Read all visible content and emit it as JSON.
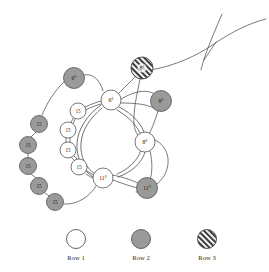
{
  "diagram": {
    "title": "",
    "background_color": "#ffffff",
    "stroke_color": "#4d4d4d",
    "node_stroke_color": "#555555",
    "fill_row1": "#ffffff",
    "fill_row2": "#9a9a9a",
    "fill_row3_base": "#ffffff",
    "fill_row3_hatch": "#3a3a3a",
    "label_color": "#1a1a1a",
    "nodes": [
      {
        "id": "n-gray-6",
        "label": "6°",
        "row": 2,
        "cx": 74,
        "cy": 78,
        "r": 10.5
      },
      {
        "id": "n-hatch-8",
        "label": "8°",
        "row": 3,
        "cx": 142,
        "cy": 68,
        "r": 11.0
      },
      {
        "id": "n-white-6",
        "label": "6°",
        "row": 1,
        "cx": 111,
        "cy": 100,
        "r": 10.0
      },
      {
        "id": "n-gray-8",
        "label": "8°",
        "row": 2,
        "cx": 161,
        "cy": 101,
        "r": 10.5
      },
      {
        "id": "n-white-8",
        "label": "8°",
        "row": 1,
        "cx": 145,
        "cy": 142,
        "r": 10.0
      },
      {
        "id": "n-white-11",
        "label": "11°",
        "row": 1,
        "cx": 103,
        "cy": 178,
        "r": 10.0
      },
      {
        "id": "n-gray-11",
        "label": "11°",
        "row": 2,
        "cx": 147,
        "cy": 188,
        "r": 10.5
      },
      {
        "id": "n-white-15-a",
        "label": "15",
        "row": 1,
        "cx": 78,
        "cy": 111,
        "r": 8.0
      },
      {
        "id": "n-white-15-b",
        "label": "15",
        "row": 1,
        "cx": 68,
        "cy": 130,
        "r": 8.0
      },
      {
        "id": "n-white-15-c",
        "label": "15",
        "row": 1,
        "cx": 68,
        "cy": 150,
        "r": 8.0
      },
      {
        "id": "n-white-15-d",
        "label": "15",
        "row": 1,
        "cx": 79,
        "cy": 167,
        "r": 8.0
      },
      {
        "id": "n-gray-15-a",
        "label": "15",
        "row": 2,
        "cx": 39,
        "cy": 124,
        "r": 8.5
      },
      {
        "id": "n-gray-15-b",
        "label": "15",
        "row": 2,
        "cx": 28,
        "cy": 145,
        "r": 8.5
      },
      {
        "id": "n-gray-15-c",
        "label": "15",
        "row": 2,
        "cx": 28,
        "cy": 166,
        "r": 8.5
      },
      {
        "id": "n-gray-15-d",
        "label": "15",
        "row": 2,
        "cx": 39,
        "cy": 186,
        "r": 8.5
      },
      {
        "id": "n-gray-15-e",
        "label": "15",
        "row": 2,
        "cx": 55,
        "cy": 202,
        "r": 8.5
      }
    ],
    "node_count": 16,
    "white_15_count": 4,
    "gray_15_count": 5
  },
  "legend": {
    "items": [
      {
        "label": "Row 1",
        "row": 1,
        "cx": 76,
        "cy": 239,
        "r": 9.5
      },
      {
        "label": "Row 2",
        "row": 2,
        "cx": 141,
        "cy": 239,
        "r": 9.5
      },
      {
        "label": "Row 3",
        "row": 3,
        "cx": 207,
        "cy": 239,
        "r": 9.5
      }
    ],
    "label_y": 257
  }
}
